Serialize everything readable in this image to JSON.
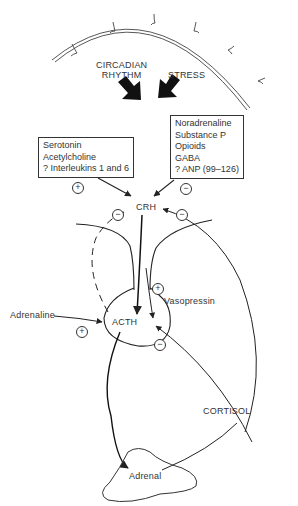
{
  "diagram": {
    "type": "hypothalamic-pituitary-adrenal axis regulation",
    "inputs": {
      "circadian": "CIRCADIAN\nRHYTHM",
      "circadian_line1": "CIRCADIAN",
      "circadian_line2": "RHYTHM",
      "stress": "STRESS"
    },
    "stimulatory_box": {
      "items": [
        "Serotonin",
        "Acetylcholine",
        "? Interleukins 1 and 6"
      ],
      "sign": "+"
    },
    "inhibitory_box": {
      "items": [
        "Noradrenaline",
        "Substance P",
        "Opioids",
        "GABA",
        "? ANP (99–126)"
      ],
      "sign": "−"
    },
    "nodes": {
      "crh": "CRH",
      "acth": "ACTH",
      "vasopressin": "Vasopressin",
      "adrenaline": "Adrenaline",
      "cortisol": "CORTISOL",
      "adrenal": "Adrenal"
    },
    "signs": {
      "plus": "+",
      "minus": "−"
    }
  }
}
